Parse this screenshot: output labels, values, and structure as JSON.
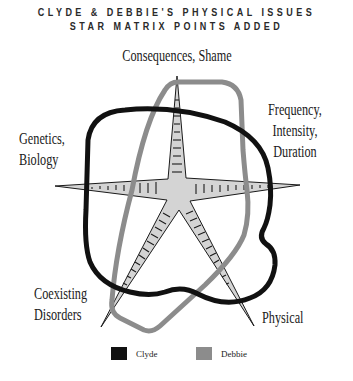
{
  "title": {
    "line1": "CLYDE & DEBBIE'S PHYSICAL ISSUES",
    "line2": "STAR MATRIX POINTS ADDED"
  },
  "axes": {
    "top": {
      "label": "Consequences, Shame"
    },
    "right": {
      "lines": [
        "Frequency,",
        "Intensity,",
        "Duration"
      ]
    },
    "left": {
      "lines": [
        "Genetics,",
        "Biology"
      ]
    },
    "bottom_left": {
      "lines": [
        "Coexisting",
        "Disorders"
      ]
    },
    "bottom_right": {
      "label": "Physical"
    }
  },
  "legend": {
    "items": [
      {
        "label": "Clyde",
        "color": "#111111"
      },
      {
        "label": "Debbie",
        "color": "#8c8c8c"
      }
    ]
  },
  "colors": {
    "star_fill": "#d4d4d4",
    "star_stroke": "#1a1a1a",
    "clyde": "#111111",
    "debbie": "#8c8c8c"
  }
}
